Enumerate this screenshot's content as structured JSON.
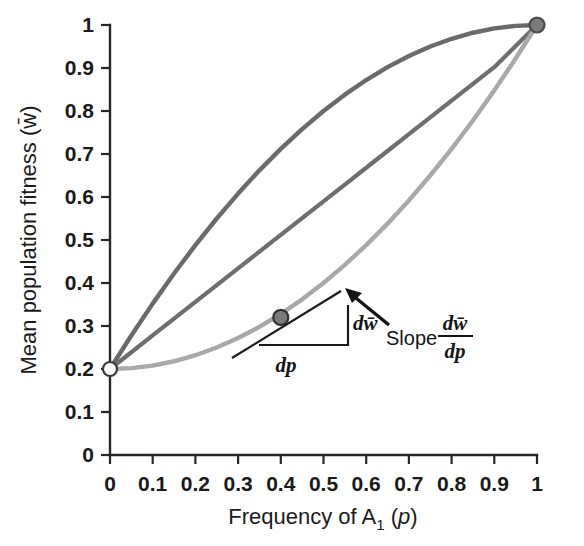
{
  "chart_data": {
    "type": "line",
    "title": "",
    "xlabel": "Frequency of A1 (p)",
    "ylabel": "Mean population fitness (w̄)",
    "xlim": [
      0,
      1
    ],
    "ylim": [
      0,
      1
    ],
    "grid": false,
    "legend": "none",
    "x_ticks": [
      "0",
      "0.1",
      "0.2",
      "0.3",
      "0.4",
      "0.5",
      "0.6",
      "0.7",
      "0.8",
      "0.9",
      "1"
    ],
    "y_ticks": [
      "0",
      "0.1",
      "0.2",
      "0.3",
      "0.4",
      "0.5",
      "0.6",
      "0.7",
      "0.8",
      "0.9",
      "1"
    ],
    "x_tick_values": [
      0,
      0.1,
      0.2,
      0.3,
      0.4,
      0.5,
      0.6,
      0.7,
      0.8,
      0.9,
      1
    ],
    "y_tick_values": [
      0,
      0.1,
      0.2,
      0.3,
      0.4,
      0.5,
      0.6,
      0.7,
      0.8,
      0.9,
      1
    ],
    "x": [
      0,
      0.05,
      0.1,
      0.15,
      0.2,
      0.25,
      0.3,
      0.35,
      0.4,
      0.45,
      0.5,
      0.55,
      0.6,
      0.65,
      0.7,
      0.75,
      0.8,
      0.85,
      0.9,
      0.95,
      1
    ],
    "series": [
      {
        "name": "A1 dominant",
        "color": "#6a6a6a",
        "width": 4.4,
        "values": [
          0.2,
          0.278,
          0.352,
          0.422,
          0.488,
          0.55,
          0.608,
          0.662,
          0.712,
          0.758,
          0.8,
          0.838,
          0.872,
          0.902,
          0.928,
          0.95,
          0.968,
          0.982,
          0.992,
          0.998,
          1.0
        ]
      },
      {
        "name": "Additive (no dominance)",
        "color": "#6e6e6e",
        "width": 4.2,
        "values": [
          0.2,
          0.239,
          0.278,
          0.317,
          0.356,
          0.395,
          0.434,
          0.473,
          0.512,
          0.551,
          0.59,
          0.629,
          0.668,
          0.707,
          0.746,
          0.785,
          0.824,
          0.863,
          0.902,
          0.951,
          1.0
        ]
      },
      {
        "name": "A1 recessive",
        "color": "#a9a9a9",
        "width": 4.4,
        "values": [
          0.2,
          0.202,
          0.208,
          0.218,
          0.232,
          0.25,
          0.272,
          0.298,
          0.328,
          0.362,
          0.4,
          0.442,
          0.488,
          0.538,
          0.592,
          0.65,
          0.712,
          0.778,
          0.848,
          0.922,
          1.0
        ]
      }
    ],
    "points": [
      {
        "name": "left-endpoint",
        "x": 0,
        "y": 0.2,
        "style": "open",
        "fill": "#ffffff",
        "stroke": "#3a3a3a"
      },
      {
        "name": "right-endpoint",
        "x": 1,
        "y": 1,
        "style": "filled",
        "fill": "#7a7a7a",
        "stroke": "#4a4a4a"
      },
      {
        "name": "tangent-point",
        "x": 0.4,
        "y": 0.32,
        "style": "filled",
        "fill": "#7a7a7a",
        "stroke": "#303030"
      }
    ],
    "annotations": {
      "slope_label": "Slope",
      "numerator": "dw̄",
      "denominator": "dp",
      "rise_label": "dw̄",
      "run_label": "dp",
      "tangent_at_x": 0.4,
      "tangent_at_y": 0.32,
      "note": "Tangent line to recessive curve at p = 0.4 with rise dw̄ over run dp"
    }
  },
  "labels": {
    "ylabel_main": "Mean population fitness (",
    "ylabel_wbar": "w̄",
    "ylabel_close": ")",
    "xlabel_main": "Frequency of A",
    "xlabel_sub": "1",
    "xlabel_paren_open": " (",
    "xlabel_p": "p",
    "xlabel_paren_close": ")"
  },
  "colors": {
    "axis": "#272727",
    "curve_dark": "#6a6a6a",
    "curve_mid": "#6e6e6e",
    "curve_light": "#a9a9a9",
    "annotation": "#141414",
    "background": "#ffffff"
  }
}
